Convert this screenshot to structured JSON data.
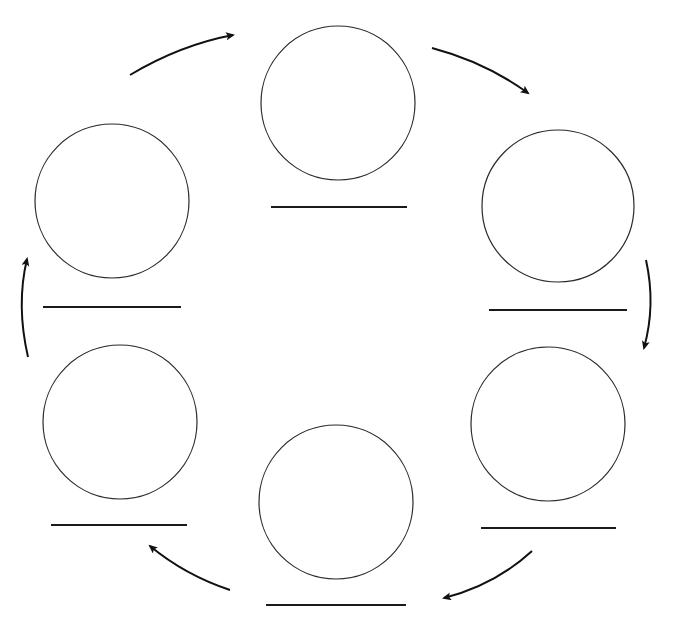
{
  "diagram": {
    "type": "cycle",
    "direction": "clockwise",
    "colors": {
      "background": "#ffffff",
      "circle_stroke": "#2a2a2a",
      "line_stroke": "#1a1a1a",
      "arrow_stroke": "#111111"
    },
    "nodes": [
      {
        "id": "top",
        "label": "",
        "cx": 338,
        "cy": 103,
        "r": 77,
        "line": {
          "x1": 271,
          "x2": 407,
          "y": 207
        }
      },
      {
        "id": "top-right",
        "label": "",
        "cx": 558,
        "cy": 206,
        "r": 76,
        "line": {
          "x1": 489,
          "x2": 627,
          "y": 310
        }
      },
      {
        "id": "bottom-right",
        "label": "",
        "cx": 548,
        "cy": 424,
        "r": 77,
        "line": {
          "x1": 481,
          "x2": 616,
          "y": 528
        }
      },
      {
        "id": "bottom",
        "label": "",
        "cx": 336,
        "cy": 502,
        "r": 77,
        "line": {
          "x1": 266,
          "x2": 406,
          "y": 605
        }
      },
      {
        "id": "bottom-left",
        "label": "",
        "cx": 120,
        "cy": 422,
        "r": 77,
        "line": {
          "x1": 51,
          "x2": 187,
          "y": 525
        }
      },
      {
        "id": "top-left",
        "label": "",
        "cx": 112,
        "cy": 201,
        "r": 77,
        "line": {
          "x1": 43,
          "x2": 181,
          "y": 307
        }
      }
    ],
    "arrows": [
      {
        "from": "top-left",
        "to": "top",
        "d": "M130,75 Q180,45 233,35"
      },
      {
        "from": "top",
        "to": "top-right",
        "d": "M432,48 Q485,62 528,93"
      },
      {
        "from": "top-right",
        "to": "bottom-right",
        "d": "M646,260 Q656,305 644,348"
      },
      {
        "from": "bottom-right",
        "to": "bottom",
        "d": "M532,551 Q495,585 444,598"
      },
      {
        "from": "bottom",
        "to": "bottom-left",
        "d": "M230,590 Q185,575 150,546"
      },
      {
        "from": "bottom-left",
        "to": "top-left",
        "d": "M28,357 Q16,305 27,259"
      }
    ]
  }
}
